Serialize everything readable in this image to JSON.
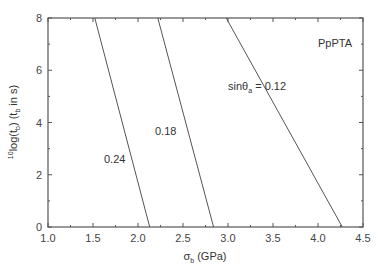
{
  "chart_data": {
    "type": "line",
    "title": "",
    "annotation": "PpPTA",
    "xlabel": "σ_b (GPa)",
    "ylabel": "10log(t_b) (t_b in s)",
    "xlim": [
      1.0,
      4.5
    ],
    "ylim": [
      0,
      8
    ],
    "xticks": [
      "1.0",
      "1.5",
      "2.0",
      "2.5",
      "3.0",
      "3.5",
      "4.0",
      "4.5"
    ],
    "yticks": [
      "0",
      "2",
      "4",
      "6",
      "8"
    ],
    "grid": false,
    "series": [
      {
        "name": "sinθa = 0.12",
        "label": "sinθa = 0.12",
        "x": [
          2.98,
          4.27
        ],
        "y": [
          8,
          0
        ]
      },
      {
        "name": "0.18",
        "label": "0.18",
        "x": [
          2.22,
          2.84
        ],
        "y": [
          8,
          0
        ]
      },
      {
        "name": "0.24",
        "label": "0.24",
        "x": [
          1.52,
          2.13
        ],
        "y": [
          8,
          0
        ]
      }
    ]
  },
  "labels": {
    "annotation": "PpPTA",
    "xlabel_sigma": "σ",
    "xlabel_sub": "b",
    "xlabel_rest": " (GPa)",
    "s012_pre": "sinθ",
    "s012_sub": "a",
    "s012_post": " = 0.12",
    "s018": "0.18",
    "s024": "0.24",
    "ylabel_pre_sup": "10",
    "ylabel_log": "log(t",
    "ylabel_sub1": "b",
    "ylabel_mid": ") (t",
    "ylabel_sub2": "b",
    "ylabel_end": " in s)"
  }
}
